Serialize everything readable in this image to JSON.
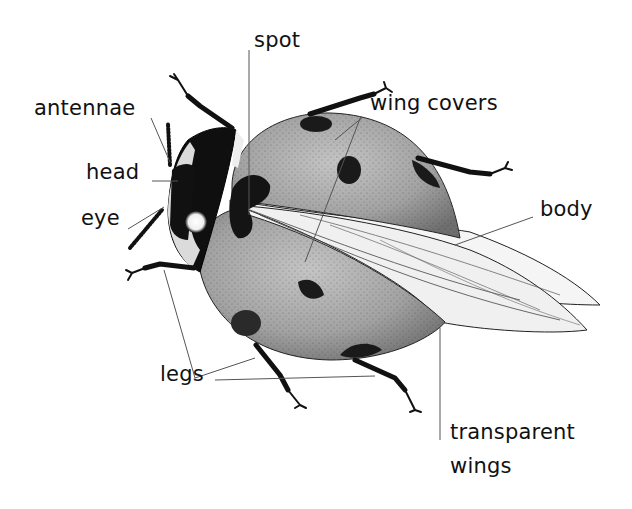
{
  "diagram": {
    "colors": {
      "background": "#ffffff",
      "ink": "#111111",
      "wing_cover": "#9a9a9a",
      "wing_cover_light": "#bdbdbd",
      "spot": "#1a1a1a",
      "wing": "#f4f4f4",
      "leader_line": "#555555"
    },
    "labels": [
      {
        "id": "spot",
        "text": "spot",
        "x": 254,
        "y": 30
      },
      {
        "id": "antennae",
        "text": "antennae",
        "x": 34,
        "y": 98
      },
      {
        "id": "wing-covers",
        "text": "wing covers",
        "x": 370,
        "y": 93
      },
      {
        "id": "head",
        "text": "head",
        "x": 86,
        "y": 162
      },
      {
        "id": "eye",
        "text": "eye",
        "x": 81,
        "y": 208
      },
      {
        "id": "body",
        "text": "body",
        "x": 540,
        "y": 199
      },
      {
        "id": "legs",
        "text": "legs",
        "x": 160,
        "y": 364
      },
      {
        "id": "transparent-wings-line1",
        "text": "transparent",
        "x": 450,
        "y": 422
      },
      {
        "id": "transparent-wings-line2",
        "text": "wings",
        "x": 450,
        "y": 456
      }
    ]
  }
}
